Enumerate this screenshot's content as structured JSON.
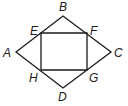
{
  "diagram": {
    "type": "geometry-figure",
    "colors": {
      "stroke": "#1a1a1a",
      "background": "#ffffff"
    },
    "points": {
      "A": {
        "label": "A",
        "x": 16,
        "y": 52
      },
      "B": {
        "label": "B",
        "x": 63,
        "y": 16
      },
      "C": {
        "label": "C",
        "x": 111,
        "y": 52
      },
      "D": {
        "label": "D",
        "x": 63,
        "y": 88
      },
      "E": {
        "label": "E",
        "x": 41,
        "y": 33
      },
      "F": {
        "label": "F",
        "x": 87,
        "y": 33
      },
      "G": {
        "label": "G",
        "x": 87,
        "y": 70
      },
      "H": {
        "label": "H",
        "x": 41,
        "y": 70
      }
    },
    "shapes": [
      {
        "name": "quadrilateral",
        "vertices": [
          "A",
          "B",
          "C",
          "D"
        ]
      },
      {
        "name": "rectangle",
        "vertices": [
          "E",
          "F",
          "G",
          "H"
        ]
      }
    ]
  }
}
